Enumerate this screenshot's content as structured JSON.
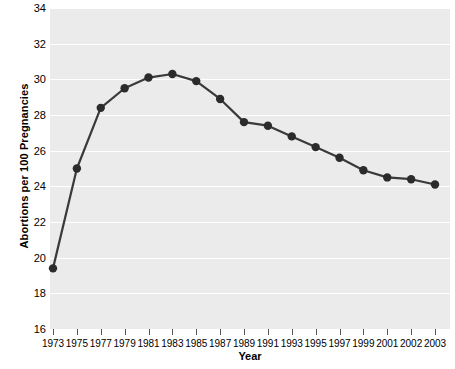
{
  "chart_data": {
    "type": "line",
    "title": "",
    "xlabel": "Year",
    "ylabel": "Abortions per 100 Pregnancies",
    "categories": [
      "1973",
      "1975",
      "1977",
      "1979",
      "1981",
      "1983",
      "1985",
      "1987",
      "1989",
      "1991",
      "1993",
      "1995",
      "1997",
      "1999",
      "2001",
      "2002",
      "2003"
    ],
    "values": [
      19.4,
      25.0,
      28.4,
      29.5,
      30.1,
      30.3,
      29.9,
      28.9,
      27.6,
      27.4,
      26.8,
      26.2,
      25.6,
      24.9,
      24.5,
      24.4,
      24.1
    ],
    "series": [
      {
        "name": "Abortions per 100 Pregnancies",
        "values": [
          19.4,
          25.0,
          28.4,
          29.5,
          30.1,
          30.3,
          29.9,
          28.9,
          27.6,
          27.4,
          26.8,
          26.2,
          25.6,
          24.9,
          24.5,
          24.4,
          24.1
        ]
      }
    ],
    "ylim": [
      16,
      34
    ],
    "yticks": [
      16,
      18,
      20,
      22,
      24,
      26,
      28,
      30,
      32,
      34
    ],
    "ytick_labels": [
      "16",
      "18",
      "20",
      "22",
      "24",
      "26",
      "28",
      "30",
      "32",
      "34"
    ],
    "grid": true,
    "grid_color": "#ffffff",
    "plot_background": "#ebebeb",
    "line_color": "#3a3a3a",
    "marker_color": "#2b2b2b",
    "marker": "circle",
    "legend": "none"
  }
}
